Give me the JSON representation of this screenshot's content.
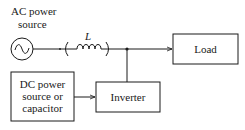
{
  "diagram": {
    "ac_source": {
      "label_line1": "AC power",
      "label_line2": "source",
      "icon": "sine-wave-icon"
    },
    "inductor": {
      "label": "L"
    },
    "load": {
      "label": "Load"
    },
    "dc_source": {
      "label_line1": "DC power",
      "label_line2": "source or",
      "label_line3": "capacitor"
    },
    "inverter": {
      "label": "Inverter"
    },
    "connections": [
      {
        "from": "AC power source",
        "to": "Inductor"
      },
      {
        "from": "Inductor",
        "to": "Junction"
      },
      {
        "from": "Junction",
        "to": "Load"
      },
      {
        "from": "Junction",
        "to": "Inverter"
      },
      {
        "from": "DC power source or capacitor",
        "to": "Inverter"
      }
    ]
  }
}
